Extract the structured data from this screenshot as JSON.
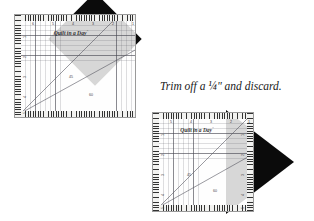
{
  "scene": {
    "width": 314,
    "height": 221,
    "background_color": "#ffffff"
  },
  "caption": {
    "text": "Trim off a ¼\" and discard.",
    "x": 160,
    "y": 88,
    "font_size": 11.5
  },
  "colors": {
    "fabric": "#0b0b0b",
    "ruler_fill": "#fcfcfa",
    "ruler_border": "#9a9a9a",
    "grid_line": "#46464f",
    "tick": "#333333",
    "text": "#2e2e2e"
  },
  "ruler_brand": {
    "name": "Quilt in a Day",
    "trademark": "®"
  },
  "rulers": [
    {
      "id": "ruler-top-left",
      "x": 14,
      "y": 14,
      "width": 122,
      "height": 104,
      "logo_x": 56,
      "logo_y": 18,
      "logo_font_size": 5.6,
      "top_numbers": [
        "6",
        "5",
        "4",
        "3",
        "2",
        "1"
      ],
      "left_numbers": [
        "1",
        "2",
        "3",
        "4",
        "5"
      ],
      "diagonals": [
        {
          "angle_label": "45",
          "label_x": 56,
          "label_y": 62
        },
        {
          "angle_label": "60",
          "label_x": 76,
          "label_y": 80
        }
      ]
    },
    {
      "id": "ruler-bottom-right",
      "x": 152,
      "y": 112,
      "width": 102,
      "height": 100,
      "logo_x": 44,
      "logo_y": 17,
      "logo_font_size": 5.4,
      "top_numbers": [
        "5",
        "4",
        "3",
        "2",
        "1"
      ],
      "left_numbers": [
        "1",
        "2",
        "3",
        "4",
        "5"
      ],
      "right_numbers": [
        "1",
        "2",
        "3",
        "4",
        "5"
      ],
      "diagonals": [
        {
          "angle_label": "45",
          "label_x": 36,
          "label_y": 62
        },
        {
          "angle_label": "60",
          "label_x": 62,
          "label_y": 78
        }
      ]
    }
  ],
  "fabric_pieces": [
    {
      "id": "fabric-diamond-top-left",
      "shape": "rotated-square",
      "x": 62,
      "y": 6,
      "size": 66,
      "rotation": 45
    },
    {
      "id": "fabric-triangle-bottom-right",
      "shape": "triangle-point-right",
      "x": 226,
      "y": 112,
      "width": 64,
      "height": 100
    }
  ]
}
